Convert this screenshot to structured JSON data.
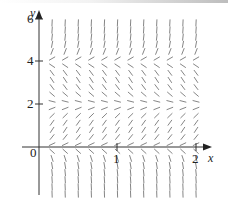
{
  "figure": {
    "type": "slope-field",
    "axes": {
      "x_label": "x",
      "y_label": "y",
      "x_ticks": [
        "0",
        "1",
        "2"
      ],
      "y_ticks": [
        "2",
        "4",
        "6"
      ],
      "origin_label": "0"
    },
    "equilibria_y": [
      0,
      2,
      4
    ],
    "slope_sign_regions": [
      {
        "range": "y < 0",
        "sign": "negative",
        "steepness": "steep"
      },
      {
        "range": "0 < y < 2",
        "sign": "positive",
        "steepness": "moderate"
      },
      {
        "range": "2 < y < 4",
        "sign": "negative",
        "steepness": "moderate"
      },
      {
        "range": "y > 4",
        "sign": "positive",
        "steepness": "steep"
      }
    ],
    "grid": {
      "x_min": 0.1667,
      "x_max": 2.0,
      "x_step": 0.1667,
      "y_min": -2.2,
      "y_max": 6.0,
      "y_step": 0.3333
    },
    "colors": {
      "axis": "#333333",
      "segment": "#777777"
    }
  }
}
